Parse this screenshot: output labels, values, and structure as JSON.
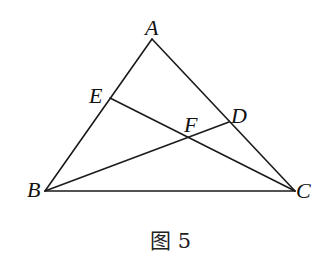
{
  "figure": {
    "caption": "图 5",
    "colors": {
      "line": "#1a1a1a",
      "text": "#111111",
      "background": "#ffffff"
    },
    "points": {
      "A": {
        "label": "A",
        "x": 152,
        "y": 39
      },
      "B": {
        "label": "B",
        "x": 45,
        "y": 191
      },
      "C": {
        "label": "C",
        "x": 295,
        "y": 191
      },
      "D": {
        "label": "D",
        "x": 229,
        "y": 122
      },
      "E": {
        "label": "E",
        "x": 110,
        "y": 98
      },
      "F": {
        "label": "F",
        "x": 188,
        "y": 137
      }
    },
    "segments": [
      {
        "name": "AB",
        "from": "A",
        "to": "B"
      },
      {
        "name": "AC",
        "from": "A",
        "to": "C"
      },
      {
        "name": "BC",
        "from": "B",
        "to": "C"
      },
      {
        "name": "CE",
        "from": "C",
        "to": "E"
      },
      {
        "name": "BD",
        "from": "B",
        "to": "D"
      }
    ]
  }
}
